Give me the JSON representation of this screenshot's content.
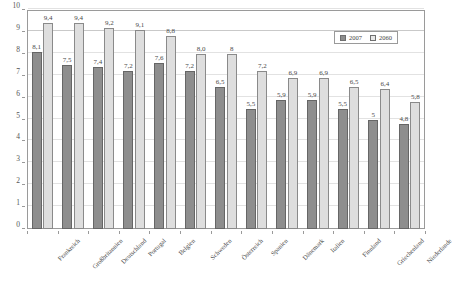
{
  "chart_data": {
    "type": "bar",
    "title": "",
    "xlabel": "",
    "ylabel": "",
    "ylim": [
      0,
      10
    ],
    "ytick_labels": [
      "0",
      "1",
      "2",
      "3",
      "4",
      "5",
      "6",
      "7",
      "8",
      "9",
      "10"
    ],
    "grid": true,
    "legend_position": "top-right",
    "categories": [
      "Frankreich",
      "Großbritannien",
      "Deutschland",
      "Portugal",
      "Belgien",
      "Schweden",
      "Österreich",
      "Spanien",
      "Dänemark",
      "Italien",
      "Finnland",
      "Griechenland",
      "Niederlande"
    ],
    "series": [
      {
        "name": "2007",
        "color": "#8e8e8e",
        "values": [
          8.1,
          7.5,
          7.4,
          7.2,
          7.6,
          7.2,
          6.5,
          5.5,
          5.9,
          5.9,
          5.5,
          5.0,
          4.8
        ],
        "labels": [
          "8,1",
          "7,5",
          "7,4",
          "7,2",
          "7,6",
          "7,2",
          "6,5",
          "5,5",
          "5,9",
          "5,9",
          "5,5",
          "5",
          "4,8"
        ]
      },
      {
        "name": "2060",
        "color": "#dedede",
        "values": [
          9.4,
          9.4,
          9.2,
          9.1,
          8.8,
          8.0,
          8.0,
          7.2,
          6.9,
          6.9,
          6.5,
          6.4,
          5.8
        ],
        "labels": [
          "9,4",
          "9,4",
          "9,2",
          "9,1",
          "8,8",
          "8,0",
          "8",
          "7,2",
          "6,9",
          "6,9",
          "6,5",
          "6,4",
          "5,8"
        ]
      }
    ]
  },
  "legend": {
    "entries": [
      {
        "label": "2007"
      },
      {
        "label": "2060"
      }
    ]
  }
}
